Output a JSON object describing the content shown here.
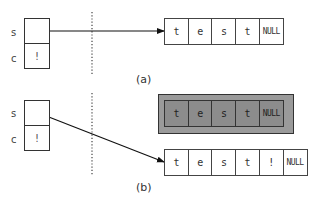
{
  "diagram": {
    "panel_a": {
      "caption": "(a)",
      "vars": [
        {
          "name": "s",
          "value": ""
        },
        {
          "name": "c",
          "value": "!"
        }
      ],
      "array": [
        "t",
        "e",
        "s",
        "t",
        "NULL"
      ]
    },
    "panel_b": {
      "caption": "(b)",
      "vars": [
        {
          "name": "s",
          "value": ""
        },
        {
          "name": "c",
          "value": "!"
        }
      ],
      "old_array": [
        "t",
        "e",
        "s",
        "t",
        "NULL"
      ],
      "new_array": [
        "t",
        "e",
        "s",
        "t",
        "!",
        "NULL"
      ]
    },
    "colors": {
      "line": "#222222",
      "old_array_fill": "#8c8c8c",
      "old_array_frame": "#9a9a9a"
    }
  }
}
